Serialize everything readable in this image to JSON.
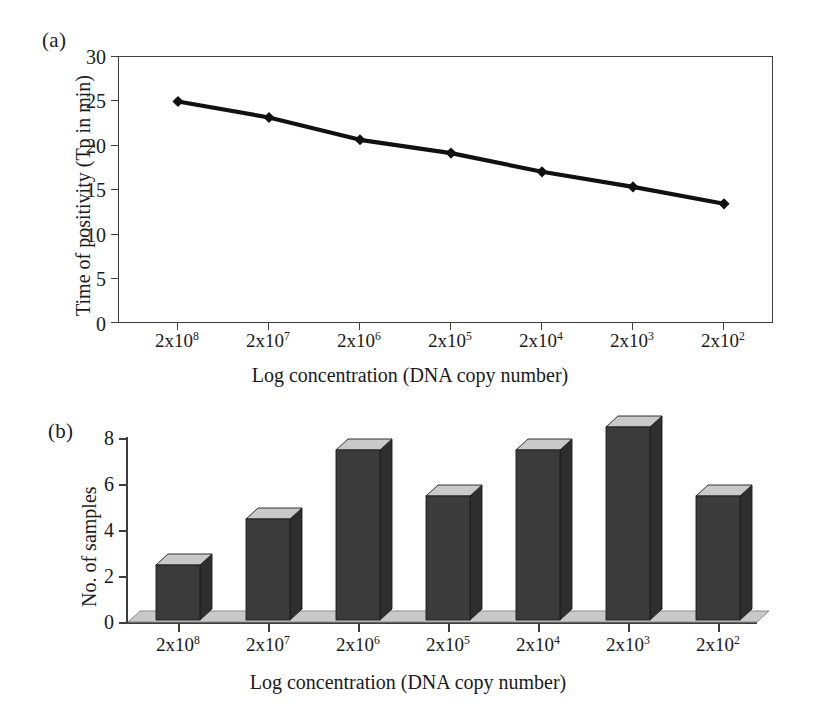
{
  "figure": {
    "panels": [
      {
        "tag": "(a)"
      },
      {
        "tag": "(b)"
      }
    ]
  },
  "chart_data": [
    {
      "type": "line",
      "panel": "(a)",
      "title": "",
      "xlabel": "Log concentration (DNA copy number)",
      "ylabel": "Time of positivity (Tp in min)",
      "categories": [
        "2x10^8",
        "2x10^7",
        "2x10^6",
        "2x10^5",
        "2x10^4",
        "2x10^3",
        "2x10^2"
      ],
      "tick_labels_x": [
        {
          "mantissa": "2x10",
          "exponent": "8"
        },
        {
          "mantissa": "2x10",
          "exponent": "7"
        },
        {
          "mantissa": "2x10",
          "exponent": "6"
        },
        {
          "mantissa": "2x10",
          "exponent": "5"
        },
        {
          "mantissa": "2x10",
          "exponent": "4"
        },
        {
          "mantissa": "2x10",
          "exponent": "3"
        },
        {
          "mantissa": "2x10",
          "exponent": "2"
        }
      ],
      "values": [
        25.0,
        23.2,
        20.7,
        19.2,
        17.1,
        15.4,
        13.5
      ],
      "marker": "diamond",
      "ylim": [
        0,
        30
      ],
      "yticks": [
        0,
        5,
        10,
        15,
        20,
        25,
        30
      ],
      "grid": false,
      "legend": null,
      "frame": "box",
      "series_color": "#111111"
    },
    {
      "type": "bar",
      "panel": "(b)",
      "title": "",
      "xlabel": "Log concentration (DNA copy number)",
      "ylabel": "No. of samples",
      "categories": [
        "2x10^8",
        "2x10^7",
        "2x10^6",
        "2x10^5",
        "2x10^4",
        "2x10^3",
        "2x10^2"
      ],
      "tick_labels_x": [
        {
          "mantissa": "2x10",
          "exponent": "8"
        },
        {
          "mantissa": "2x10",
          "exponent": "7"
        },
        {
          "mantissa": "2x10",
          "exponent": "6"
        },
        {
          "mantissa": "2x10",
          "exponent": "5"
        },
        {
          "mantissa": "2x10",
          "exponent": "4"
        },
        {
          "mantissa": "2x10",
          "exponent": "3"
        },
        {
          "mantissa": "2x10",
          "exponent": "2"
        }
      ],
      "values": [
        2,
        4,
        7,
        5,
        7,
        8,
        5
      ],
      "ylim": [
        0,
        8
      ],
      "yticks": [
        0,
        2,
        4,
        6,
        8
      ],
      "grid": false,
      "legend": null,
      "style": "3d-column",
      "bar_color": "#3b3b3b",
      "bar_top_color": "#c9c9c9",
      "bar_side_color": "#2e2e2e",
      "floor_color": "#c9c9c9"
    }
  ]
}
